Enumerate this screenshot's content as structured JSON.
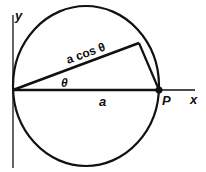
{
  "diagram": {
    "axis_labels": {
      "y": "y",
      "x": "x"
    },
    "point_label": "P",
    "chord_label": "a cos θ",
    "angle_label": "θ",
    "radius_label": "a",
    "colors": {
      "stroke": "#111111",
      "background": "#ffffff"
    }
  }
}
